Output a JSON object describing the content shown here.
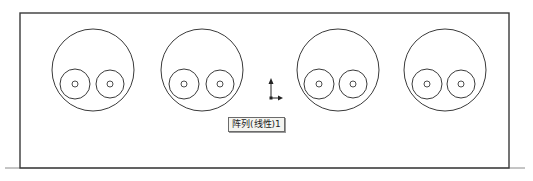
{
  "drawing": {
    "stroke_color": "#3a3a3a",
    "frame": {
      "x": 20,
      "y": 13,
      "width": 489,
      "height": 155
    },
    "ground_line": {
      "x1": 5,
      "x2": 525,
      "y": 168
    },
    "patterns": [
      {
        "cx": 93,
        "cy": 70,
        "r": 41,
        "holes": [
          {
            "cx": 75,
            "cy": 84,
            "r": 15,
            "inner_r": 3
          },
          {
            "cx": 110,
            "cy": 84,
            "r": 14,
            "inner_r": 3
          }
        ]
      },
      {
        "cx": 202,
        "cy": 70,
        "r": 41,
        "holes": [
          {
            "cx": 184,
            "cy": 84,
            "r": 15,
            "inner_r": 3
          },
          {
            "cx": 220,
            "cy": 84,
            "r": 14,
            "inner_r": 3
          }
        ]
      },
      {
        "cx": 338,
        "cy": 70,
        "r": 41,
        "holes": [
          {
            "cx": 319,
            "cy": 84,
            "r": 15,
            "inner_r": 3
          },
          {
            "cx": 353,
            "cy": 84,
            "r": 14,
            "inner_r": 3
          }
        ]
      },
      {
        "cx": 445,
        "cy": 70,
        "r": 41,
        "holes": [
          {
            "cx": 427,
            "cy": 84,
            "r": 15,
            "inner_r": 3
          },
          {
            "cx": 461,
            "cy": 84,
            "r": 14,
            "inner_r": 3
          }
        ]
      }
    ],
    "axis_icon": "coordinate-axes-icon"
  },
  "tooltip": {
    "label": "阵列(线性)1"
  }
}
